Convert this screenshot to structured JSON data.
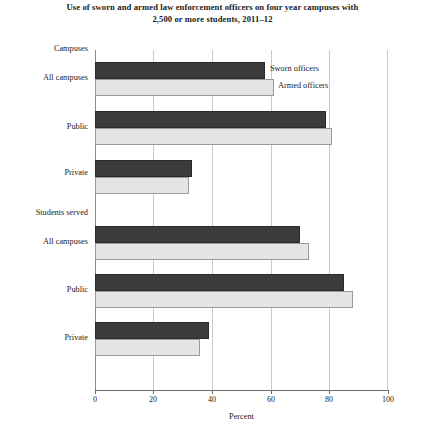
{
  "chart": {
    "title": "Use of sworn and armed law enforcement officers on four year campuses with 2,500 or more students, 2011–12",
    "xlabel": "Percent",
    "group_headers": [
      "Campuses",
      "Students served"
    ],
    "legend": [
      "Sworn officers",
      "Armed officers"
    ],
    "ticks": [
      "0",
      "20",
      "40",
      "60",
      "80",
      "100"
    ]
  },
  "chart_data": {
    "type": "bar",
    "orientation": "horizontal",
    "title": "Use of sworn and armed law enforcement officers on four year campuses with 2,500 or more students, 2011–12",
    "xlabel": "Percent",
    "ylabel": "",
    "xlim": [
      0,
      100
    ],
    "xticks": [
      0,
      20,
      40,
      60,
      80,
      100
    ],
    "grid": "vertical",
    "legend_position": "inline-right-of-first-group",
    "group_headers": [
      "Campuses",
      "Students served"
    ],
    "categories": [
      "Campuses – All campuses",
      "Campuses – Public",
      "Campuses – Private",
      "Students served – All campuses",
      "Students served – Public",
      "Students served – Private"
    ],
    "series": [
      {
        "name": "Sworn officers",
        "color": "#3b3b3b",
        "values": [
          58,
          79,
          33,
          70,
          85,
          39
        ]
      },
      {
        "name": "Armed officers",
        "color": "#e4e4e4",
        "values": [
          61,
          81,
          32,
          73,
          88,
          36
        ]
      }
    ]
  }
}
